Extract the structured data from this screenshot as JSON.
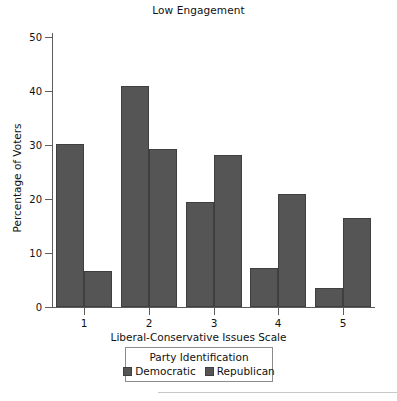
{
  "chart_data": {
    "type": "bar",
    "title": "Low Engagement",
    "xlabel": "Liberal-Conservative Issues Scale",
    "ylabel": "Percentage of Voters",
    "categories": [
      "1",
      "2",
      "3",
      "4",
      "5"
    ],
    "series": [
      {
        "name": "Democratic",
        "values": [
          30.1,
          41.0,
          19.5,
          7.3,
          3.5
        ],
        "color": "#555555"
      },
      {
        "name": "Republican",
        "values": [
          6.7,
          29.2,
          28.2,
          21.0,
          16.5
        ],
        "color": "#555555"
      }
    ],
    "ylim": [
      0,
      50
    ],
    "yticks": [
      0,
      10,
      20,
      30,
      40,
      50
    ],
    "ytick_labels": [
      "0",
      "10",
      "20",
      "30",
      "40",
      "50"
    ],
    "grid": false,
    "legend": {
      "title": "Party Identification",
      "position": "below-axes",
      "entries": [
        "Democratic",
        "Republican"
      ]
    },
    "bar_edge_color": "#3f3f3f",
    "axis_color": "#5d5d5d"
  },
  "figure": {
    "title": "Low Engagement",
    "axis": {
      "y_title": "Percentage of Voters",
      "x_title": "Liberal-Conservative Issues Scale"
    },
    "legend_title": "Party Identification"
  }
}
